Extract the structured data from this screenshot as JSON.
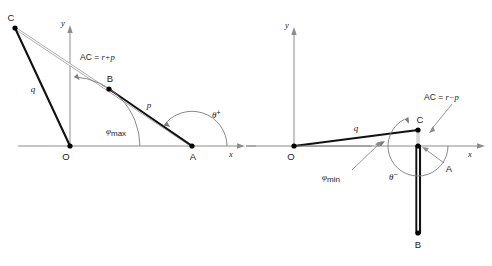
{
  "figure": {
    "background_color": "#ffffff",
    "line_color": "#111111",
    "axis_color": "#8c8c8c",
    "arc_color": "#7a7a7a",
    "panels": [
      {
        "id": "left",
        "name": "maximum-angle-configuration",
        "axes": {
          "x_label": "x",
          "y_label": "y",
          "origin_label": "O"
        },
        "points": [
          {
            "name": "O",
            "label": "O",
            "x": 70,
            "y": 146
          },
          {
            "name": "A",
            "label": "A",
            "x": 192,
            "y": 146
          },
          {
            "name": "B",
            "label": "B",
            "x": 109,
            "y": 89
          },
          {
            "name": "C",
            "label": "C",
            "x": 15,
            "y": 28
          }
        ],
        "segments": [
          {
            "name": "link-q",
            "label": "q",
            "from": "O",
            "to": "C"
          },
          {
            "name": "link-p",
            "label": "p",
            "from": "A",
            "to": "B"
          },
          {
            "name": "link-AC",
            "label": "AC = r+p",
            "from": "A",
            "to": "C"
          }
        ],
        "relation": {
          "lhs": "AC",
          "op": "=",
          "rhs": "r+p"
        },
        "angles": [
          {
            "name": "phi-max",
            "symbol": "φ",
            "subscript": "max",
            "at": "O",
            "description": "angle from +x axis to OC"
          },
          {
            "name": "theta-plus",
            "symbol": "θ",
            "superscript": "+",
            "at": "A",
            "description": "angle from +x axis to AB"
          }
        ]
      },
      {
        "id": "right",
        "name": "minimum-angle-configuration",
        "axes": {
          "x_label": "x",
          "y_label": "y",
          "origin_label": "O"
        },
        "points": [
          {
            "name": "O",
            "label": "O",
            "x": 294,
            "y": 146
          },
          {
            "name": "A",
            "label": "A",
            "x": 418,
            "y": 146
          },
          {
            "name": "B",
            "label": "B",
            "x": 418,
            "y": 233
          },
          {
            "name": "C",
            "label": "C",
            "x": 418,
            "y": 130
          }
        ],
        "segments": [
          {
            "name": "link-q",
            "label": "q",
            "from": "O",
            "to": "C"
          },
          {
            "name": "link-p",
            "label": "p",
            "from": "A",
            "to": "B"
          },
          {
            "name": "link-AC",
            "label": "AC = r−p",
            "from": "A",
            "to": "C"
          }
        ],
        "relation": {
          "lhs": "AC",
          "op": "=",
          "rhs": "r−p"
        },
        "angles": [
          {
            "name": "phi-min",
            "symbol": "φ",
            "subscript": "min",
            "at": "O",
            "description": "angle from +x axis to OC"
          },
          {
            "name": "theta-minus",
            "symbol": "θ",
            "superscript": "−",
            "at": "A",
            "description": "angle from +x axis to AB"
          }
        ]
      }
    ]
  },
  "labels": {
    "AC_left": "AC = ",
    "AC_left_rhs": "r+p",
    "AC_right": "AC = ",
    "AC_right_rhs": "r−p",
    "phi": "φ",
    "theta": "θ",
    "max": "max",
    "min": "min",
    "plus": "+",
    "minus": "−",
    "q": "q",
    "p": "p",
    "x": "x",
    "y": "y",
    "O": "O",
    "A": "A",
    "B": "B",
    "C": "C"
  }
}
